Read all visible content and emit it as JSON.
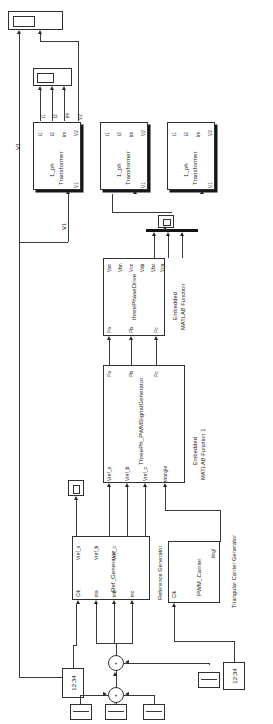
{
  "diagram": {
    "orientation": "rotated-90-ccw"
  },
  "blocks": {
    "transformer_a": {
      "name": "1_ph Transformer",
      "line1": "1_ph",
      "line2": "Transformer",
      "ports_top": [
        "i1",
        "i2",
        "im",
        "V2"
      ],
      "ports_bottom": [
        "V1"
      ]
    },
    "transformer_b": {
      "name": "1_ph Transformer",
      "line1": "1_ph",
      "line2": "Transformer",
      "ports_top": [
        "i1",
        "i2",
        "im",
        "V2"
      ],
      "ports_bottom": [
        "V1"
      ]
    },
    "transformer_c": {
      "name": "1_ph Transformer",
      "line1": "1_ph",
      "line2": "Transformer",
      "ports_top": [
        "i1",
        "i2",
        "im",
        "V2"
      ],
      "ports_bottom": [
        "V1"
      ]
    },
    "three_phase_drive": {
      "name": "threePhaseDrive",
      "annotation_line1": "Embedded",
      "annotation_line2": "MATLAB Function",
      "outputs": [
        "Van",
        "Vbn",
        "Vcn",
        "Vab",
        "Vbc",
        "Vca"
      ],
      "inputs": [
        "Pa",
        "Pb",
        "Pc"
      ]
    },
    "pwm_signal_generator": {
      "name": "ThreePh_PWMSignalGenerator",
      "annotation_line1": "Embedded",
      "annotation_line2": "MATLAB Function 1",
      "outputs": [
        "Pa",
        "Pb",
        "Pc"
      ],
      "inputs": [
        "Vref_a",
        "Vref_b",
        "Vref_c",
        "triangle"
      ]
    },
    "ref_generator": {
      "name": "Ref_Generator",
      "annotation": "Reference Generator",
      "outputs": [
        "Vref_a",
        "Vref_b",
        "Vref_c"
      ],
      "inputs": [
        "Clk",
        "ma",
        "mb",
        "mc"
      ]
    },
    "pwm_carrier": {
      "name": "PWM_Carrier",
      "annotation": "Triangular Carrier Generator",
      "inputs": [
        "Clk"
      ],
      "outputs": [
        "tingl"
      ]
    },
    "clock_left": {
      "label": "12:34"
    },
    "clock_right": {
      "label": "12:34"
    }
  },
  "signal_labels": {
    "v1_long": "V1",
    "v1_transformer_a": "V1",
    "v1_bus": "V1",
    "v2_a": "V2",
    "v2_b": "V2",
    "v2_c": "V2"
  },
  "scopes": {
    "scope_top": {
      "name": "scope",
      "inputs": 2
    },
    "scope_mid": {
      "name": "scope",
      "inputs": 3
    },
    "scope_bus": {
      "name": "scope",
      "inputs": 3
    },
    "scope_ref": {
      "name": "scope",
      "inputs": 1
    }
  },
  "sums": {
    "sum_upper": {
      "sign": "+"
    },
    "sum_lower": {
      "sign": "+"
    }
  },
  "colors": {
    "block_stroke": "#303030",
    "wire": "#3a3a3a",
    "shadow": "#161616",
    "background": "#ffffff",
    "text": "#1d1d1d"
  }
}
